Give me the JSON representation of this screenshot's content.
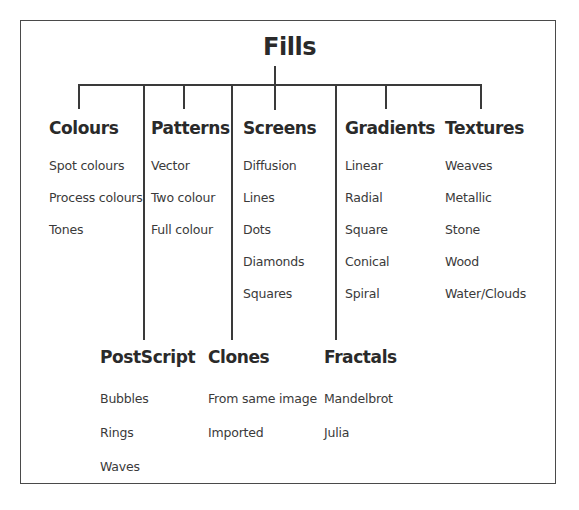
{
  "diagram": {
    "type": "tree",
    "title": "Fills",
    "upper_categories": [
      {
        "heading": "Colours",
        "items": [
          "Spot colours",
          "Process colours",
          "Tones"
        ]
      },
      {
        "heading": "Patterns",
        "items": [
          "Vector",
          "Two colour",
          "Full colour"
        ]
      },
      {
        "heading": "Screens",
        "items": [
          "Diffusion",
          "Lines",
          "Dots",
          "Diamonds",
          "Squares"
        ]
      },
      {
        "heading": "Gradients",
        "items": [
          "Linear",
          "Radial",
          "Square",
          "Conical",
          "Spiral"
        ]
      },
      {
        "heading": "Textures",
        "items": [
          "Weaves",
          "Metallic",
          "Stone",
          "Wood",
          "Water/Clouds"
        ]
      }
    ],
    "lower_categories": [
      {
        "heading": "PostScript",
        "items": [
          "Bubbles",
          "Rings",
          "Waves"
        ]
      },
      {
        "heading": "Clones",
        "items": [
          "From same image",
          "Imported"
        ]
      },
      {
        "heading": "Fractals",
        "items": [
          "Mandelbrot",
          "Julia"
        ]
      }
    ]
  },
  "colors": {
    "line": "#3a3a3a",
    "text": "#2b2b2b",
    "background": "#ffffff"
  }
}
